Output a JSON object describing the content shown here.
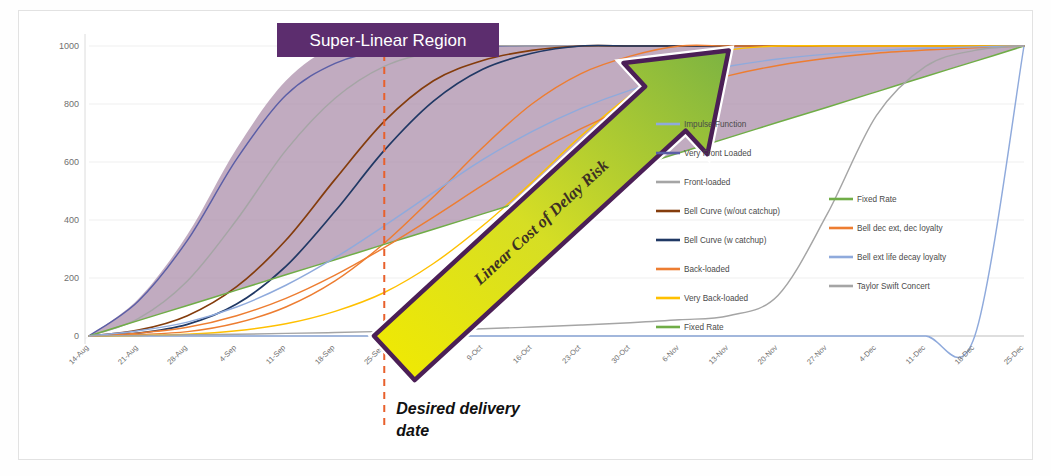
{
  "chart_data": {
    "type": "line",
    "title": "",
    "xlabel": "",
    "ylabel": "",
    "ylim": [
      0,
      1000
    ],
    "ytick_labels": [
      "0",
      "200",
      "400",
      "600",
      "800",
      "1000"
    ],
    "ytick_values": [
      0,
      200,
      400,
      600,
      800,
      1000
    ],
    "grid": true,
    "legend_position": "right",
    "categories": [
      "14-Aug",
      "21-Aug",
      "28-Aug",
      "4-Sep",
      "11-Sep",
      "18-Sep",
      "25-Sep",
      "2-Oct",
      "9-Oct",
      "16-Oct",
      "23-Oct",
      "30-Oct",
      "6-Nov",
      "13-Nov",
      "20-Nov",
      "27-Nov",
      "4-Dec",
      "11-Dec",
      "18-Dec",
      "25-Dec"
    ],
    "series": [
      {
        "name": "Impulse Function",
        "color": "#8FAADC",
        "values": [
          0,
          0,
          0,
          0,
          0,
          0,
          0,
          0,
          0,
          0,
          0,
          0,
          0,
          0,
          0,
          0,
          0,
          0,
          0,
          1000
        ]
      },
      {
        "name": "Very Front Loaded",
        "color": "#5B5EA6",
        "values": [
          0,
          120,
          330,
          610,
          830,
          940,
          985,
          1000,
          1000,
          1000,
          1000,
          1000,
          1000,
          1000,
          1000,
          1000,
          1000,
          1000,
          1000,
          1000
        ]
      },
      {
        "name": "Front-loaded",
        "color": "#A5A5A5",
        "values": [
          0,
          60,
          190,
          400,
          640,
          820,
          930,
          980,
          1000,
          1000,
          1000,
          1000,
          1000,
          1000,
          1000,
          1000,
          1000,
          1000,
          1000,
          1000
        ]
      },
      {
        "name": "Bell Curve (w/out catchup)",
        "color": "#843C0C",
        "values": [
          0,
          20,
          70,
          170,
          330,
          540,
          740,
          880,
          950,
          985,
          1000,
          1000,
          1000,
          1000,
          1000,
          1000,
          1000,
          1000,
          1000,
          1000
        ]
      },
      {
        "name": "Bell Curve (w catchup)",
        "color": "#203864",
        "values": [
          0,
          10,
          40,
          110,
          240,
          430,
          640,
          810,
          920,
          975,
          1000,
          1000,
          1000,
          1000,
          1000,
          1000,
          1000,
          1000,
          1000,
          1000
        ]
      },
      {
        "name": "Back-loaded",
        "color": "#ED7D31",
        "values": [
          0,
          5,
          15,
          45,
          100,
          190,
          320,
          480,
          650,
          800,
          905,
          965,
          1000,
          1000,
          1000,
          1000,
          1000,
          1000,
          1000,
          1000
        ]
      },
      {
        "name": "Very Back-loaded",
        "color": "#FFC000",
        "values": [
          0,
          2,
          6,
          18,
          42,
          85,
          150,
          250,
          380,
          530,
          690,
          830,
          930,
          985,
          1000,
          1000,
          1000,
          1000,
          1000,
          1000
        ]
      },
      {
        "name": "Fixed Rate",
        "color": "#70AD47",
        "values": [
          0,
          53,
          105,
          158,
          211,
          263,
          316,
          368,
          421,
          474,
          526,
          579,
          632,
          684,
          737,
          789,
          842,
          895,
          947,
          1000
        ]
      },
      {
        "name": "Bell dec ext, dec loyalty",
        "color": "#ED7D31",
        "values": [
          0,
          10,
          30,
          70,
          130,
          210,
          305,
          410,
          520,
          625,
          715,
          790,
          850,
          898,
          933,
          958,
          975,
          986,
          994,
          1000
        ]
      },
      {
        "name": "Bell ext life decay loyalty",
        "color": "#8FAADC",
        "values": [
          0,
          18,
          48,
          100,
          175,
          270,
          380,
          495,
          608,
          705,
          785,
          848,
          896,
          930,
          955,
          972,
          984,
          992,
          997,
          1000
        ]
      },
      {
        "name": "Taylor Swift Concert",
        "color": "#A5A5A5",
        "values": [
          0,
          2,
          4,
          6,
          9,
          12,
          16,
          20,
          25,
          31,
          38,
          46,
          56,
          70,
          140,
          420,
          760,
          930,
          985,
          1000
        ]
      }
    ]
  },
  "annotations": {
    "banner_label": "Super-Linear Region",
    "banner_color": "#5C2D6E",
    "arrow_label": "Linear Cost of Delay Risk",
    "arrow_fill_start": "#F2EA00",
    "arrow_fill_end": "#7CB342",
    "arrow_outline": "#4B1F56",
    "delivery_label_line1": "Desired delivery",
    "delivery_label_line2": "date",
    "delivery_marker_date": "25-Sep",
    "delivery_marker_color": "#E8602C",
    "region_fill": "#A98BA8"
  },
  "legend": {
    "column1": [
      {
        "label": "Impulse Function",
        "color": "#8FAADC"
      },
      {
        "label": "Very Front Loaded",
        "color": "#5B5EA6"
      },
      {
        "label": "Front-loaded",
        "color": "#A5A5A5"
      },
      {
        "label": "Bell Curve (w/out catchup)",
        "color": "#843C0C"
      },
      {
        "label": "Bell Curve (w catchup)",
        "color": "#203864"
      },
      {
        "label": "Back-loaded",
        "color": "#ED7D31"
      },
      {
        "label": "Very Back-loaded",
        "color": "#FFC000"
      },
      {
        "label": "Fixed Rate",
        "color": "#70AD47"
      }
    ],
    "column2": [
      {
        "label": "Fixed Rate",
        "color": "#70AD47"
      },
      {
        "label": "Bell dec ext, dec loyalty",
        "color": "#ED7D31"
      },
      {
        "label": "Bell ext life decay loyalty",
        "color": "#8FAADC"
      },
      {
        "label": "Taylor Swift Concert",
        "color": "#A5A5A5"
      }
    ]
  }
}
